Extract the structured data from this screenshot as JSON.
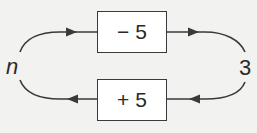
{
  "diagram": {
    "input_label": "n",
    "output_label": "3",
    "top_operation": "− 5",
    "bottom_operation": "+ 5",
    "colors": {
      "stroke": "#3a3a3a",
      "background": "#f2f2f0",
      "box_fill": "#ffffff"
    }
  }
}
